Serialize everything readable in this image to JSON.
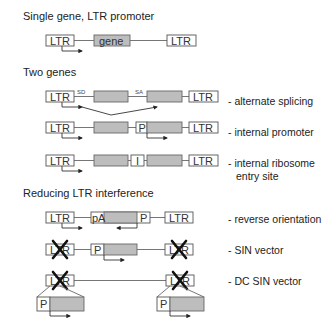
{
  "sections": {
    "single_gene": {
      "title": "Single gene, LTR promoter"
    },
    "two_genes": {
      "title": "Two genes"
    },
    "reducing": {
      "title": "Reducing LTR interference"
    }
  },
  "elements": {
    "ltr": "LTR",
    "gene": "gene",
    "promoter": "P",
    "ires": "I",
    "polya": "pA",
    "splice_donor": "SD",
    "splice_acceptor": "SA"
  },
  "rows": [
    {
      "id": "single",
      "label": ""
    },
    {
      "id": "alt-splicing",
      "label": "- alternate splicing"
    },
    {
      "id": "internal-promoter",
      "label": "- internal promoter"
    },
    {
      "id": "ires",
      "label": "- internal ribosome",
      "label2": "entry site"
    },
    {
      "id": "reverse",
      "label": "- reverse orientation"
    },
    {
      "id": "sin",
      "label": "- SIN vector"
    },
    {
      "id": "dc-sin",
      "label": "- DC SIN vector"
    }
  ],
  "colors": {
    "gene_fill": "#bdbdbd",
    "box_stroke": "#555555",
    "line": "#666666"
  }
}
